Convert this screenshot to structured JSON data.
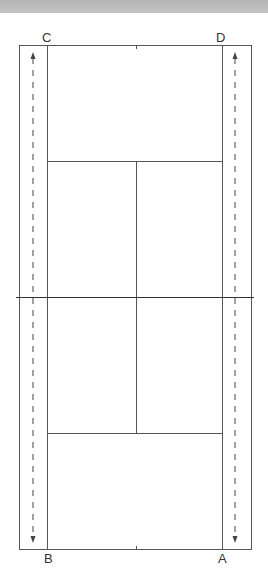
{
  "diagram": {
    "type": "tennis-court-top-view",
    "colors": {
      "line": "#555555",
      "arrow": "#444444",
      "top_strip": "#bcbcbc",
      "background": "#ffffff"
    },
    "corners": {
      "top_left": "C",
      "top_right": "D",
      "bottom_left": "B",
      "bottom_right": "A"
    },
    "arrows": [
      {
        "side": "left",
        "direction": "bidirectional",
        "style": "dashed"
      },
      {
        "side": "right",
        "direction": "bidirectional",
        "style": "dashed"
      }
    ]
  }
}
